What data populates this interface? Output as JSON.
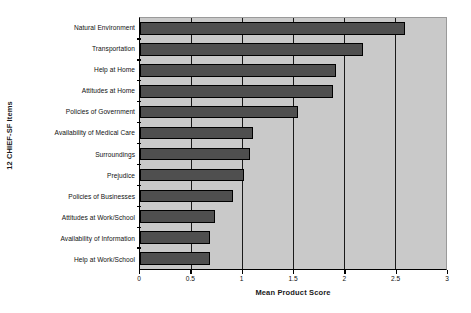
{
  "chart_data": {
    "type": "bar",
    "orientation": "horizontal",
    "title": "",
    "xlabel": "Mean Product Score",
    "ylabel": "12 CHIEF-SF Items",
    "xlim": [
      0,
      3
    ],
    "xticks": [
      "0",
      "0.5",
      "1",
      "1.5",
      "2",
      "2.5",
      "3"
    ],
    "xtick_values": [
      0,
      0.5,
      1,
      1.5,
      2,
      2.5,
      3
    ],
    "grid": true,
    "legend": false,
    "categories": [
      "Natural Environment",
      "Transportation",
      "Help at Home",
      "Attitudes at Home",
      "Policies of Government",
      "Availability of Medical Care",
      "Surroundings",
      "Prejudice",
      "Policies of Businesses",
      "Attitudes at Work/School",
      "Availability of Information",
      "Help at Work/School"
    ],
    "values": [
      2.6,
      2.19,
      1.92,
      1.89,
      1.55,
      1.11,
      1.08,
      1.02,
      0.91,
      0.74,
      0.69,
      0.69
    ],
    "colors": {
      "bar_fill": "#4f4f4f",
      "bar_edge": "#000000",
      "plot_background": "#c9c9c9",
      "gridline": "#1a1a1a",
      "axis": "#000000",
      "figure_background": "#ffffff"
    }
  }
}
